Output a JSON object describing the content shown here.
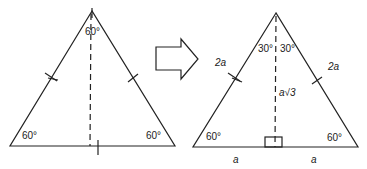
{
  "left_triangle": {
    "apex_angle": "60°",
    "left_angle": "60°",
    "right_angle": "60°"
  },
  "right_triangle": {
    "left_top_angle": "30°",
    "right_top_angle": "30°",
    "left_side": "2a",
    "right_side": "2a",
    "height": "a√3",
    "left_base": "a",
    "right_base": "a",
    "left_angle": "60°",
    "right_angle": "60°"
  },
  "colors": {
    "stroke": "#222222",
    "background": "#ffffff"
  }
}
